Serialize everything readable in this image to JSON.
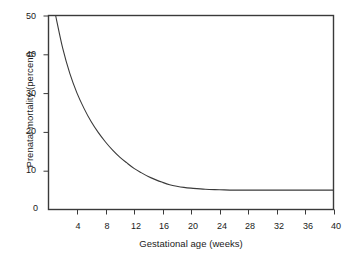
{
  "chart_data": {
    "type": "area",
    "title": "",
    "xlabel": "Gestational age (weeks)",
    "ylabel": "Prenatal mortality (percent)",
    "xlim": [
      0,
      40
    ],
    "ylim": [
      0,
      50
    ],
    "xticks": [
      4,
      8,
      12,
      16,
      20,
      24,
      28,
      32,
      36,
      40
    ],
    "yticks": [
      0,
      10,
      20,
      30,
      40,
      50
    ],
    "origin_label": "0",
    "grid": false,
    "legend": null,
    "fill_color": "#e6e6e6",
    "line_color": "#3a3a3a",
    "frame_color": "#3a3a3a",
    "series": [
      {
        "name": "Prenatal mortality",
        "x": [
          1,
          2,
          3,
          4,
          5,
          6,
          7,
          8,
          9,
          10,
          11,
          12,
          13,
          14,
          15,
          16,
          17,
          18,
          19,
          20,
          22,
          24,
          26,
          28,
          30,
          32,
          34,
          36,
          38,
          40
        ],
        "values": [
          50.0,
          41.5,
          35.0,
          30.0,
          26.0,
          22.6,
          19.8,
          17.4,
          15.3,
          13.5,
          12.0,
          10.6,
          9.5,
          8.5,
          7.7,
          7.0,
          6.4,
          6.0,
          5.7,
          5.5,
          5.2,
          5.1,
          5.0,
          5.0,
          5.0,
          5.0,
          5.0,
          5.0,
          5.0,
          5.0
        ]
      }
    ]
  },
  "axis": {
    "y_title": "Prenatal mortality (percent)",
    "x_title": "Gestational age (weeks)",
    "y_labels": [
      "50",
      "40",
      "30",
      "20",
      "10"
    ],
    "x_labels": [
      "4",
      "8",
      "12",
      "16",
      "20",
      "24",
      "28",
      "32",
      "36",
      "40"
    ],
    "origin": "0"
  }
}
